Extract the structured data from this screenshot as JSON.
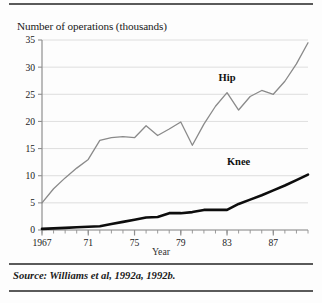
{
  "figure": {
    "title": "Number of operations (thousands)",
    "xaxis_title": "Year",
    "source_note": "Source: Williams et al, 1992a, 1992b.",
    "rules": {
      "top": "top-rule",
      "middle": "middle-rule",
      "bottom": "bottom-rule"
    }
  },
  "colors": {
    "hip_line": "#8a8a8a",
    "knee_line": "#0d0d0d",
    "gridline": "#d6d6d6",
    "axis": "#8f8f8f",
    "text": "#1a1a1a",
    "rule": "#5a5a5a",
    "background": "#fdfdfd"
  },
  "chart_data": {
    "type": "line",
    "title": "Number of operations (thousands)",
    "xlabel": "Year",
    "ylabel": "Number of operations (thousands)",
    "xlim": [
      1967,
      1990
    ],
    "ylim": [
      0,
      35
    ],
    "grid": true,
    "legend": "inline-labels",
    "ytick_labels": [
      "0",
      "5",
      "10",
      "15",
      "20",
      "25",
      "30",
      "35"
    ],
    "ytick_values": [
      0,
      5,
      10,
      15,
      20,
      25,
      30,
      35
    ],
    "xtick_labels": [
      "1967",
      "71",
      "75",
      "79",
      "83",
      "87"
    ],
    "xtick_values": [
      1967,
      1971,
      1975,
      1979,
      1983,
      1987
    ],
    "minor_xticks_every": 1,
    "x": [
      1967,
      1968,
      1969,
      1970,
      1971,
      1972,
      1973,
      1974,
      1975,
      1976,
      1977,
      1978,
      1979,
      1980,
      1981,
      1982,
      1983,
      1984,
      1985,
      1986,
      1987,
      1988,
      1989,
      1990
    ],
    "series": [
      {
        "name": "Hip",
        "color": "#8a8a8a",
        "line_width": 1.3,
        "label_x": 1983,
        "label_y": 27.5,
        "values": [
          5.0,
          7.6,
          9.6,
          11.4,
          13.0,
          16.5,
          17.0,
          17.2,
          17.0,
          19.2,
          17.4,
          18.6,
          19.9,
          15.6,
          19.5,
          22.8,
          25.3,
          22.1,
          24.6,
          25.7,
          25.0,
          27.4,
          30.6,
          34.5
        ]
      },
      {
        "name": "Knee",
        "color": "#0d0d0d",
        "line_width": 2.6,
        "label_x": 1984,
        "label_y": 12.0,
        "values": [
          0.2,
          0.3,
          0.4,
          0.5,
          0.6,
          0.7,
          1.1,
          1.5,
          1.9,
          2.3,
          2.4,
          3.1,
          3.1,
          3.3,
          3.7,
          3.7,
          3.7,
          4.8,
          5.6,
          6.4,
          7.3,
          8.2,
          9.2,
          10.2
        ]
      }
    ]
  }
}
